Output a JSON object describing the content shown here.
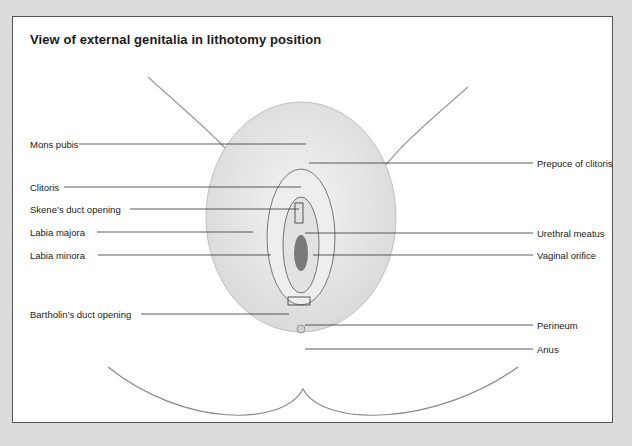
{
  "figure": {
    "title": "View of external genitalia in lithotomy position"
  },
  "labels_left": [
    {
      "text": "Mons pubis",
      "y": 122
    },
    {
      "text": "Clitoris",
      "y": 165
    },
    {
      "text": "Skene’s duct opening",
      "y": 187
    },
    {
      "text": "Labia majora",
      "y": 210
    },
    {
      "text": "Labia minora",
      "y": 233
    },
    {
      "text": "Bartholin’s duct opening",
      "y": 292
    }
  ],
  "labels_right": [
    {
      "text": "Prepuce of clitoris",
      "y": 141
    },
    {
      "text": "Urethral meatus",
      "y": 211
    },
    {
      "text": "Vaginal orifice",
      "y": 233
    },
    {
      "text": "Perineum",
      "y": 303
    },
    {
      "text": "Anus",
      "y": 327
    }
  ],
  "colors": {
    "page_background": "#dcdcdc",
    "panel_background": "#ffffff",
    "border": "#555555",
    "text": "#222222",
    "leader_line": "#333333"
  }
}
